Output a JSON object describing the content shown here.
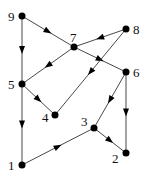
{
  "diagram": {
    "type": "directed-graph",
    "nodes": [
      {
        "id": "1",
        "label": "1",
        "x": 22,
        "y": 165,
        "lx": 8,
        "ly": 170
      },
      {
        "id": "2",
        "label": "2",
        "x": 126,
        "y": 153,
        "lx": 112,
        "ly": 163
      },
      {
        "id": "3",
        "label": "3",
        "x": 94,
        "y": 128,
        "lx": 81,
        "ly": 126
      },
      {
        "id": "4",
        "label": "4",
        "x": 55,
        "y": 115,
        "lx": 42,
        "ly": 122
      },
      {
        "id": "5",
        "label": "5",
        "x": 22,
        "y": 84,
        "lx": 8,
        "ly": 89
      },
      {
        "id": "6",
        "label": "6",
        "x": 126,
        "y": 72,
        "lx": 133,
        "ly": 77
      },
      {
        "id": "7",
        "label": "7",
        "x": 74,
        "y": 47,
        "lx": 70,
        "ly": 42
      },
      {
        "id": "8",
        "label": "8",
        "x": 126,
        "y": 29,
        "lx": 133,
        "ly": 34
      },
      {
        "id": "9",
        "label": "9",
        "x": 22,
        "y": 16,
        "lx": 8,
        "ly": 21
      }
    ],
    "edges": [
      {
        "from": "9",
        "to": "7"
      },
      {
        "from": "9",
        "to": "5"
      },
      {
        "from": "8",
        "to": "7"
      },
      {
        "from": "7",
        "to": "5"
      },
      {
        "from": "7",
        "to": "6"
      },
      {
        "from": "8",
        "to": "4"
      },
      {
        "from": "5",
        "to": "4"
      },
      {
        "from": "5",
        "to": "1"
      },
      {
        "from": "6",
        "to": "3"
      },
      {
        "from": "6",
        "to": "2"
      },
      {
        "from": "3",
        "to": "2"
      },
      {
        "from": "1",
        "to": "3"
      }
    ],
    "colors": {
      "node": "#000000",
      "edge": "#333333",
      "background": "#ffffff"
    }
  }
}
